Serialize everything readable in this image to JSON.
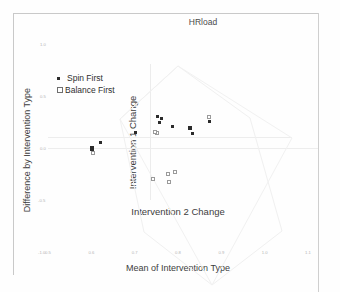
{
  "chart_data": {
    "type": "scatter",
    "title": "HRload",
    "xlabel": "Mean of Intervention Type",
    "ylabel": "Difference by Intervention Type",
    "inner_xlabel": "Intervention 2 Change",
    "inner_ylabel": "Intervention 1 Change",
    "xlim": [
      0.5,
      1.1
    ],
    "ylim": [
      -1.0,
      1.0
    ],
    "xticks": [
      "0.5",
      "0.6",
      "0.7",
      "0.8",
      "0.9",
      "1.0",
      "1.1"
    ],
    "yticks": [
      "1.0",
      "0.5",
      "0.0",
      "-0.5",
      "-1.0"
    ],
    "grid": false,
    "legend_position": "upper-left",
    "series": [
      {
        "name": "Spin First",
        "marker": "filled-square",
        "color": "#2b2b2b",
        "points": [
          {
            "x": 0.601,
            "y": -0.005
          },
          {
            "x": 0.62,
            "y": 0.055
          },
          {
            "x": 0.702,
            "y": 0.15
          },
          {
            "x": 0.753,
            "y": 0.3
          },
          {
            "x": 0.757,
            "y": 0.248
          },
          {
            "x": 0.762,
            "y": 0.282
          },
          {
            "x": 0.787,
            "y": 0.205
          },
          {
            "x": 0.828,
            "y": 0.195
          },
          {
            "x": 0.833,
            "y": 0.14
          },
          {
            "x": 0.872,
            "y": 0.258
          }
        ]
      },
      {
        "name": "Balance First",
        "marker": "open-square",
        "color": "#9a9a9a",
        "points": [
          {
            "x": 0.603,
            "y": -0.052
          },
          {
            "x": 0.752,
            "y": 0.148
          },
          {
            "x": 0.748,
            "y": 0.15
          },
          {
            "x": 0.872,
            "y": 0.298
          },
          {
            "x": 0.742,
            "y": -0.3
          },
          {
            "x": 0.777,
            "y": -0.25
          },
          {
            "x": 0.779,
            "y": -0.33
          },
          {
            "x": 0.793,
            "y": -0.232
          }
        ]
      }
    ]
  },
  "legend": {
    "spin_first": "Spin First",
    "balance_first": "Balance First"
  }
}
